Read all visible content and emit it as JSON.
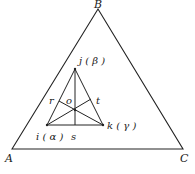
{
  "diagram": {
    "type": "ternary-phase-triangle",
    "outer_triangle": {
      "vertices": {
        "A": {
          "label": "A",
          "x": 12,
          "y": 149
        },
        "B": {
          "label": "B",
          "x": 98,
          "y": 9
        },
        "C": {
          "label": "C",
          "x": 183,
          "y": 149
        }
      }
    },
    "inner_triangle": {
      "vertices": {
        "i": {
          "label": "i ( α )",
          "x": 47,
          "y": 125
        },
        "j": {
          "label": "j ( β )",
          "x": 75,
          "y": 69
        },
        "k": {
          "label": "k ( γ )",
          "x": 103,
          "y": 125
        }
      },
      "center": {
        "label": "o",
        "x": 75,
        "y": 110
      },
      "edge_points": {
        "r": {
          "label": "r",
          "x": 59,
          "y": 101
        },
        "t": {
          "label": "t",
          "x": 91,
          "y": 99
        },
        "s": {
          "label": "s",
          "x": 75,
          "y": 125
        }
      }
    },
    "colors": {
      "line": "#222222",
      "background": "#ffffff"
    }
  }
}
